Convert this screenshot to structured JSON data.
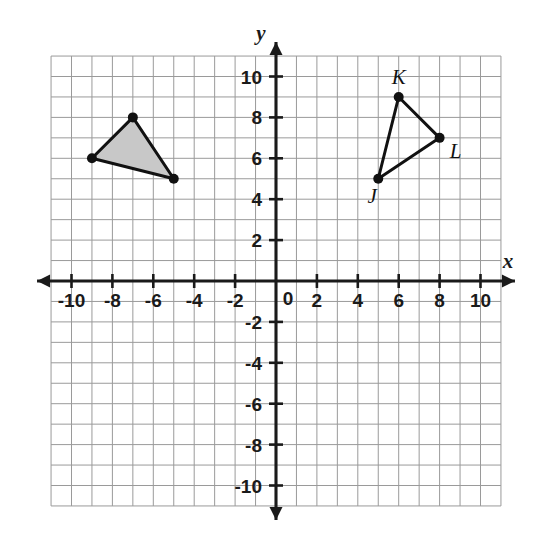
{
  "figure": {
    "background_color": "#ffffff",
    "grid_color": "#9a9a9a",
    "axis_color": "#1a1a1a",
    "shape_stroke_color": "#111111",
    "shaded_fill_color": "#c8c8c8"
  },
  "axes": {
    "x_label": "x",
    "y_label": "y",
    "origin_label": "0",
    "x_range": [
      -11,
      11
    ],
    "y_range": [
      -11,
      11
    ],
    "x_tick_labels": [
      "-10",
      "-8",
      "-6",
      "-4",
      "-2",
      "2",
      "4",
      "6",
      "8",
      "10"
    ],
    "x_tick_values": [
      -10,
      -8,
      -6,
      -4,
      -2,
      2,
      4,
      6,
      8,
      10
    ],
    "y_tick_labels": [
      "10",
      "8",
      "6",
      "4",
      "2",
      "-2",
      "-4",
      "-6",
      "-8",
      "-10"
    ],
    "y_tick_values": [
      10,
      8,
      6,
      4,
      2,
      -2,
      -4,
      -6,
      -8,
      -10
    ],
    "tick_interval": 2,
    "grid_interval": 1,
    "grid_visible": true,
    "arrows": [
      "left",
      "right",
      "up",
      "down"
    ]
  },
  "chart_data": {
    "type": "scatter",
    "xlabel": "x",
    "ylabel": "y",
    "xlim": [
      -11,
      11
    ],
    "ylim": [
      -11,
      11
    ],
    "grid": true,
    "legend": "none",
    "series": [
      {
        "name": "shaded-triangle",
        "filled": true,
        "fill_color": "#c8c8c8",
        "labels_shown": false,
        "points": [
          {
            "label": "",
            "x": -9,
            "y": 6
          },
          {
            "label": "",
            "x": -7,
            "y": 8
          },
          {
            "label": "",
            "x": -5,
            "y": 5
          }
        ]
      },
      {
        "name": "triangle-JKL",
        "filled": false,
        "fill_color": "none",
        "labels_shown": true,
        "points": [
          {
            "label": "J",
            "x": 5,
            "y": 5
          },
          {
            "label": "K",
            "x": 6,
            "y": 9
          },
          {
            "label": "L",
            "x": 8,
            "y": 7
          }
        ]
      }
    ]
  },
  "shapes": {
    "shaded_triangle": {
      "name": "shaded-triangle",
      "vertices": [
        [
          -9,
          6
        ],
        [
          -7,
          8
        ],
        [
          -5,
          5
        ]
      ]
    },
    "triangle_jkl": {
      "name": "triangle-JKL",
      "vertices": [
        [
          5,
          5
        ],
        [
          6,
          9
        ],
        [
          8,
          7
        ]
      ],
      "vertex_labels": [
        "J",
        "K",
        "L"
      ]
    }
  }
}
